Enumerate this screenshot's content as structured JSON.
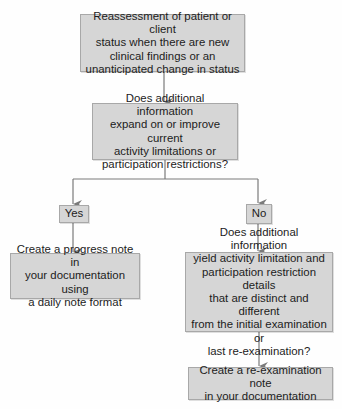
{
  "diagram": {
    "type": "flowchart",
    "nodes": {
      "start": {
        "label": "Reassessment of patient or client\nstatus when there are new\nclinical findings or an\nunanticipated change in status"
      },
      "question1": {
        "label": "Does additional information\nexpand on or improve current\nactivity limitations or\nparticipation restrictions?"
      },
      "yes": {
        "label": "Yes"
      },
      "no": {
        "label": "No"
      },
      "progress_note": {
        "label": "Create a progress note in\nyour documentation using\na daily note format"
      },
      "question2": {
        "label": "Does additional information\nyield activity limitation and\nparticipation restriction details\nthat are distinct and different\nfrom the initial examination or\nlast re-examination?"
      },
      "reexam_note": {
        "label": "Create a re-examination note\nin your documentation"
      }
    },
    "edges": [
      {
        "from": "start",
        "to": "question1"
      },
      {
        "from": "question1",
        "to": "yes"
      },
      {
        "from": "question1",
        "to": "no"
      },
      {
        "from": "yes",
        "to": "progress_note"
      },
      {
        "from": "no",
        "to": "question2"
      },
      {
        "from": "question2",
        "to": "reexam_note"
      }
    ],
    "colors": {
      "box_fill": "#d6d6d6",
      "box_border": "#a8a8a8",
      "connector": "#7a7a7a"
    }
  }
}
